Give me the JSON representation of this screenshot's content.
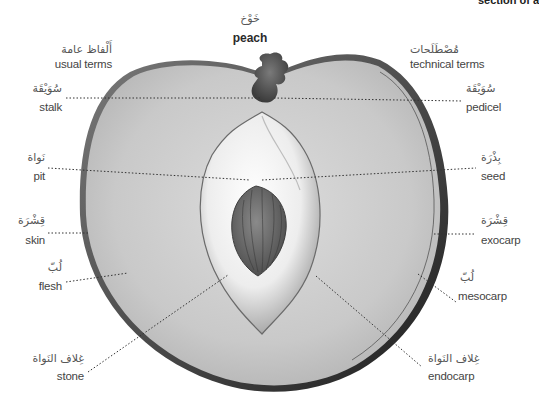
{
  "header": {
    "cut_text": "section of a"
  },
  "title": {
    "arabic": "خَوْخ",
    "english": "peach"
  },
  "columns": {
    "left": {
      "arabic": "أَلْفاظ عامة",
      "english": "usual terms"
    },
    "right": {
      "arabic": "مُصْطَلَحات",
      "english": "technical terms"
    }
  },
  "labels_left": [
    {
      "arabic": "سُوَيْقَة",
      "english": "stalk"
    },
    {
      "arabic": "نَواة",
      "english": "pit"
    },
    {
      "arabic": "قِشْرَة",
      "english": "skin"
    },
    {
      "arabic": "لُبّ",
      "english": "flesh"
    },
    {
      "arabic": "غِلاف النَواة",
      "english": "stone"
    }
  ],
  "labels_right": [
    {
      "arabic": "سُوَيْقَة",
      "english": "pedicel"
    },
    {
      "arabic": "بِذْرَة",
      "english": "seed"
    },
    {
      "arabic": "قِشْرَة",
      "english": "exocarp"
    },
    {
      "arabic": "لُبّ",
      "english": "mesocarp"
    },
    {
      "arabic": "غِلاف النَواة",
      "english": "endocarp"
    }
  ],
  "colors": {
    "flesh": "#c8c8c8",
    "outline": "#2b2b2b",
    "stone_light": "#f2f2f2",
    "seed": "#6e6e6e",
    "stalk": "#555555",
    "leader_line": "#333333"
  }
}
